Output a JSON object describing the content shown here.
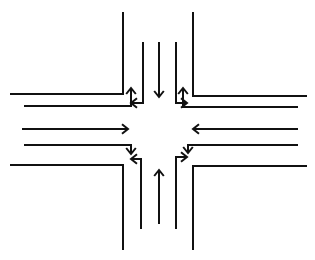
{
  "diagram": {
    "type": "intersection-lane-diagram",
    "stroke_color": "#111111",
    "background": "#ffffff",
    "curbs": [
      {
        "id": "curb-top-left",
        "points": [
          [
            123,
            12
          ],
          [
            123,
            94
          ],
          [
            10,
            94
          ]
        ]
      },
      {
        "id": "curb-top-right",
        "points": [
          [
            193,
            12
          ],
          [
            193,
            96
          ],
          [
            307,
            96
          ]
        ]
      },
      {
        "id": "curb-bottom-left",
        "points": [
          [
            10,
            165
          ],
          [
            123,
            165
          ],
          [
            123,
            250
          ]
        ]
      },
      {
        "id": "curb-bottom-right",
        "points": [
          [
            307,
            166
          ],
          [
            193,
            166
          ],
          [
            193,
            250
          ]
        ]
      }
    ],
    "arrows": [
      {
        "id": "north-through-southbound",
        "direction": "down",
        "points": [
          [
            159,
            42
          ],
          [
            159,
            97
          ]
        ]
      },
      {
        "id": "north-left-turn",
        "direction": "left-then-down",
        "points": [
          [
            143,
            42
          ],
          [
            143,
            103
          ],
          [
            131,
            103
          ]
        ]
      },
      {
        "id": "north-right-turn",
        "direction": "down-then-right",
        "points": [
          [
            176,
            42
          ],
          [
            176,
            103
          ],
          [
            187,
            103
          ]
        ]
      },
      {
        "id": "west-through-eastbound",
        "direction": "right",
        "points": [
          [
            22,
            129
          ],
          [
            128,
            129
          ]
        ]
      },
      {
        "id": "west-uturn-up",
        "direction": "right-then-up",
        "points": [
          [
            24,
            106
          ],
          [
            131,
            106
          ],
          [
            131,
            88
          ]
        ]
      },
      {
        "id": "west-right-down",
        "direction": "right-then-down",
        "points": [
          [
            24,
            145
          ],
          [
            131,
            145
          ],
          [
            131,
            154
          ]
        ]
      },
      {
        "id": "east-through-westbound",
        "direction": "left",
        "points": [
          [
            298,
            129
          ],
          [
            193,
            129
          ]
        ]
      },
      {
        "id": "east-turn-up",
        "direction": "left-then-up",
        "points": [
          [
            298,
            107
          ],
          [
            183,
            107
          ],
          [
            183,
            88
          ]
        ]
      },
      {
        "id": "east-turn-down",
        "direction": "left-then-down",
        "points": [
          [
            298,
            145
          ],
          [
            188,
            145
          ],
          [
            188,
            153
          ]
        ]
      },
      {
        "id": "south-through-northbound",
        "direction": "up",
        "points": [
          [
            159,
            224
          ],
          [
            159,
            170
          ]
        ]
      },
      {
        "id": "south-left-turn",
        "direction": "up-then-left",
        "points": [
          [
            141,
            229
          ],
          [
            141,
            159
          ],
          [
            131,
            159
          ]
        ]
      },
      {
        "id": "south-right-turn",
        "direction": "up-then-right",
        "points": [
          [
            176,
            229
          ],
          [
            176,
            157
          ],
          [
            187,
            157
          ]
        ]
      }
    ]
  }
}
